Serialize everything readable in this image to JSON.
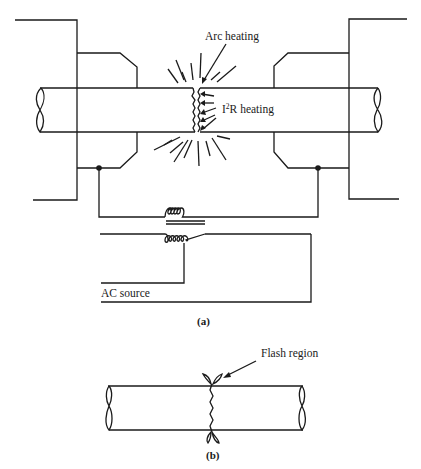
{
  "figure_a": {
    "caption": "(a)",
    "labels": {
      "arc_heating": "Arc heating",
      "i2r_heating_prefix": "I",
      "i2r_heating_sup": "2",
      "i2r_heating_suffix": "R heating",
      "ac_source": "AC source"
    },
    "components": [
      "left-rod",
      "right-rod",
      "left-clamp",
      "right-clamp",
      "transformer",
      "ac-source-circuit"
    ]
  },
  "figure_b": {
    "caption": "(b)",
    "labels": {
      "flash_region": "Flash region"
    },
    "components": [
      "welded-rod",
      "flash-region"
    ]
  },
  "colors": {
    "line": "#1a1a1a",
    "background": "#ffffff"
  }
}
